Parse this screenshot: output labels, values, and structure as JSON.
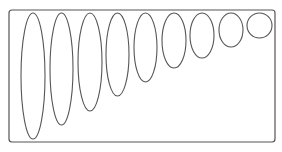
{
  "diagram": {
    "stroke_color": "#555555",
    "background": "#ffffff",
    "frame": {
      "x": 9,
      "y": 10,
      "width": 266,
      "height": 132,
      "radius": 3
    },
    "ellipses": [
      {
        "cx": 33,
        "cy": 76,
        "rx": 12,
        "ry": 63
      },
      {
        "cx": 61.5,
        "cy": 69,
        "rx": 11.5,
        "ry": 56
      },
      {
        "cx": 90,
        "cy": 62,
        "rx": 12,
        "ry": 49
      },
      {
        "cx": 117.5,
        "cy": 54.5,
        "rx": 11.5,
        "ry": 41.5
      },
      {
        "cx": 145.5,
        "cy": 47.5,
        "rx": 11.5,
        "ry": 34.5
      },
      {
        "cx": 174,
        "cy": 40.5,
        "rx": 12,
        "ry": 27.5
      },
      {
        "cx": 202,
        "cy": 35.5,
        "rx": 12,
        "ry": 22.5
      },
      {
        "cx": 231,
        "cy": 30,
        "rx": 12,
        "ry": 17
      },
      {
        "cx": 259.5,
        "cy": 25.5,
        "rx": 12.5,
        "ry": 12.5
      }
    ]
  }
}
